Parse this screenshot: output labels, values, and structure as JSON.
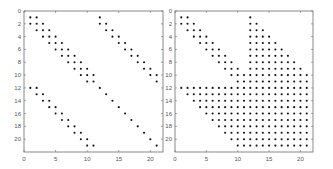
{
  "chart_data": [
    {
      "type": "scatter",
      "subtype": "spy",
      "title": "",
      "xlabel": "",
      "ylabel": "",
      "xlim": [
        0,
        22
      ],
      "ylim": [
        22,
        0
      ],
      "xticks": [
        0,
        5,
        10,
        15,
        20
      ],
      "yticks": [
        0,
        2,
        4,
        6,
        8,
        10,
        12,
        14,
        16,
        18,
        20
      ],
      "grid": false,
      "marker_color": "#111111",
      "rows": {
        "1": [
          1,
          2,
          12
        ],
        "2": [
          1,
          2,
          3,
          12,
          13
        ],
        "3": [
          2,
          3,
          4,
          13,
          14
        ],
        "4": [
          3,
          4,
          5,
          14,
          15
        ],
        "5": [
          4,
          5,
          6,
          15,
          16
        ],
        "6": [
          5,
          6,
          7,
          16,
          17
        ],
        "7": [
          6,
          7,
          8,
          17,
          18
        ],
        "8": [
          7,
          8,
          9,
          18,
          19
        ],
        "9": [
          8,
          9,
          10,
          19,
          20
        ],
        "10": [
          9,
          10,
          11,
          20,
          21
        ],
        "11": [
          10,
          11,
          21
        ],
        "12": [
          1,
          2,
          12
        ],
        "13": [
          2,
          3,
          13
        ],
        "14": [
          3,
          4,
          14
        ],
        "15": [
          4,
          5,
          15
        ],
        "16": [
          5,
          6,
          16
        ],
        "17": [
          6,
          7,
          17
        ],
        "18": [
          7,
          8,
          18
        ],
        "19": [
          8,
          9,
          19
        ],
        "20": [
          9,
          10,
          20
        ],
        "21": [
          10,
          11,
          21
        ]
      }
    },
    {
      "type": "scatter",
      "subtype": "spy",
      "title": "",
      "xlabel": "",
      "ylabel": "",
      "xlim": [
        0,
        22
      ],
      "ylim": [
        22,
        0
      ],
      "xticks": [
        0,
        5,
        10,
        15,
        20
      ],
      "yticks": [
        0,
        2,
        4,
        6,
        8,
        10,
        12,
        14,
        16,
        18,
        20
      ],
      "grid": false,
      "marker_color": "#111111",
      "rows": {
        "1": [
          1,
          2,
          12
        ],
        "2": [
          1,
          2,
          3,
          12,
          13
        ],
        "3": [
          2,
          3,
          4,
          12,
          13,
          14
        ],
        "4": [
          3,
          4,
          5,
          12,
          13,
          14,
          15
        ],
        "5": [
          4,
          5,
          6,
          12,
          13,
          14,
          15,
          16
        ],
        "6": [
          5,
          6,
          7,
          12,
          13,
          14,
          15,
          16,
          17
        ],
        "7": [
          6,
          7,
          8,
          12,
          13,
          14,
          15,
          16,
          17,
          18
        ],
        "8": [
          7,
          8,
          9,
          12,
          13,
          14,
          15,
          16,
          17,
          18,
          19
        ],
        "9": [
          8,
          9,
          10,
          12,
          13,
          14,
          15,
          16,
          17,
          18,
          19,
          20
        ],
        "10": [
          9,
          10,
          11,
          12,
          13,
          14,
          15,
          16,
          17,
          18,
          19,
          20,
          21
        ],
        "11": [
          10,
          11,
          12,
          13,
          14,
          15,
          16,
          17,
          18,
          19,
          20,
          21
        ],
        "12": [
          1,
          2,
          3,
          4,
          5,
          6,
          7,
          8,
          9,
          10,
          11,
          12,
          13,
          14,
          15,
          16,
          17,
          18,
          19,
          20,
          21
        ],
        "13": [
          2,
          3,
          4,
          5,
          6,
          7,
          8,
          9,
          10,
          11,
          12,
          13,
          14,
          15,
          16,
          17,
          18,
          19,
          20,
          21
        ],
        "14": [
          3,
          4,
          5,
          6,
          7,
          8,
          9,
          10,
          11,
          12,
          13,
          14,
          15,
          16,
          17,
          18,
          19,
          20,
          21
        ],
        "15": [
          4,
          5,
          6,
          7,
          8,
          9,
          10,
          11,
          12,
          13,
          14,
          15,
          16,
          17,
          18,
          19,
          20,
          21
        ],
        "16": [
          5,
          6,
          7,
          8,
          9,
          10,
          11,
          12,
          13,
          14,
          15,
          16,
          17,
          18,
          19,
          20,
          21
        ],
        "17": [
          6,
          7,
          8,
          9,
          10,
          11,
          12,
          13,
          14,
          15,
          16,
          17,
          18,
          19,
          20,
          21
        ],
        "18": [
          7,
          8,
          9,
          10,
          11,
          12,
          13,
          14,
          15,
          16,
          17,
          18,
          19,
          20,
          21
        ],
        "19": [
          8,
          9,
          10,
          11,
          12,
          13,
          14,
          15,
          16,
          17,
          18,
          19,
          20,
          21
        ],
        "20": [
          9,
          10,
          11,
          12,
          13,
          14,
          15,
          16,
          17,
          18,
          19,
          20,
          21
        ],
        "21": [
          10,
          11,
          12,
          13,
          14,
          15,
          16,
          17,
          18,
          19,
          20,
          21
        ]
      }
    }
  ],
  "layout": {
    "plots": [
      {
        "x0": 24,
        "y0": 11,
        "x1": 163,
        "y1": 152
      },
      {
        "x0": 175,
        "y0": 11,
        "x1": 313,
        "y1": 152
      }
    ]
  }
}
